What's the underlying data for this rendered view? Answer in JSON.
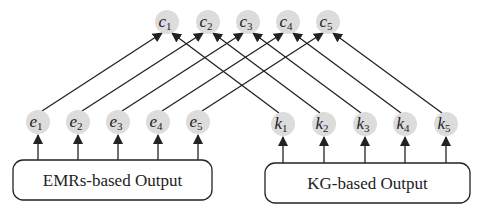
{
  "diagram": {
    "title": "",
    "colors": {
      "node_fill": "#dcdcdc",
      "line": "#222222",
      "box_stroke": "#222222",
      "background": "#ffffff"
    },
    "top_nodes": [
      {
        "id": "c1",
        "letter": "c",
        "sub": "1",
        "x": 167,
        "y": 22
      },
      {
        "id": "c2",
        "letter": "c",
        "sub": "2",
        "x": 208,
        "y": 22
      },
      {
        "id": "c3",
        "letter": "c",
        "sub": "3",
        "x": 248,
        "y": 22
      },
      {
        "id": "c4",
        "letter": "c",
        "sub": "4",
        "x": 288,
        "y": 22
      },
      {
        "id": "c5",
        "letter": "c",
        "sub": "5",
        "x": 328,
        "y": 22
      }
    ],
    "left_nodes": [
      {
        "id": "e1",
        "letter": "e",
        "sub": "1",
        "x": 38,
        "y": 122
      },
      {
        "id": "e2",
        "letter": "e",
        "sub": "2",
        "x": 78,
        "y": 122
      },
      {
        "id": "e3",
        "letter": "e",
        "sub": "3",
        "x": 118,
        "y": 122
      },
      {
        "id": "e4",
        "letter": "e",
        "sub": "4",
        "x": 158,
        "y": 122
      },
      {
        "id": "e5",
        "letter": "e",
        "sub": "5",
        "x": 198,
        "y": 122
      }
    ],
    "right_nodes": [
      {
        "id": "k1",
        "letter": "k",
        "sub": "1",
        "x": 283,
        "y": 124
      },
      {
        "id": "k2",
        "letter": "k",
        "sub": "2",
        "x": 324,
        "y": 124
      },
      {
        "id": "k3",
        "letter": "k",
        "sub": "3",
        "x": 365,
        "y": 124
      },
      {
        "id": "k4",
        "letter": "k",
        "sub": "4",
        "x": 405,
        "y": 124
      },
      {
        "id": "k5",
        "letter": "k",
        "sub": "5",
        "x": 446,
        "y": 124
      }
    ],
    "edges": [
      {
        "from": "e1",
        "to": "c1"
      },
      {
        "from": "e2",
        "to": "c2"
      },
      {
        "from": "e3",
        "to": "c3"
      },
      {
        "from": "e4",
        "to": "c4"
      },
      {
        "from": "e5",
        "to": "c5"
      },
      {
        "from": "k1",
        "to": "c1"
      },
      {
        "from": "k2",
        "to": "c2"
      },
      {
        "from": "k3",
        "to": "c3"
      },
      {
        "from": "k4",
        "to": "c4"
      },
      {
        "from": "k5",
        "to": "c5"
      }
    ],
    "boxes": [
      {
        "id": "emrs",
        "label": "EMRs-based Output",
        "x": 13,
        "y": 160,
        "w": 199,
        "h": 40,
        "feeds": [
          "e1",
          "e2",
          "e3",
          "e4",
          "e5"
        ]
      },
      {
        "id": "kg",
        "label": "KG-based Output",
        "x": 265,
        "y": 163,
        "w": 205,
        "h": 40,
        "feeds": [
          "k1",
          "k2",
          "k3",
          "k4",
          "k5"
        ]
      }
    ]
  }
}
